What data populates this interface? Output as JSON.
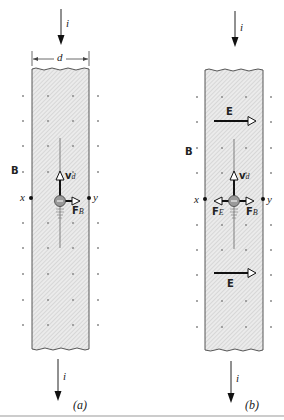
{
  "figure": {
    "panels": [
      {
        "id": "a",
        "caption": "(a)",
        "current_label": "i",
        "width_label": "d",
        "field_label": "B",
        "point_left": "x",
        "point_right": "y",
        "velocity_label": "v",
        "velocity_sub": "d",
        "magnetic_force_label": "F",
        "magnetic_force_sub": "B"
      },
      {
        "id": "b",
        "caption": "(b)",
        "current_label": "i",
        "field_label": "B",
        "point_left": "x",
        "point_right": "y",
        "velocity_label": "v",
        "velocity_sub": "d",
        "magnetic_force_label": "F",
        "magnetic_force_sub": "B",
        "electric_force_label": "F",
        "electric_force_sub": "E",
        "electric_field_top": "E",
        "electric_field_bottom": "E"
      }
    ],
    "colors": {
      "strip_fill": "#e6e6e6",
      "hatch": "#c8c8c8",
      "line": "#222222",
      "dot": "#888888",
      "electron_fill": "#9a9a9a"
    }
  }
}
